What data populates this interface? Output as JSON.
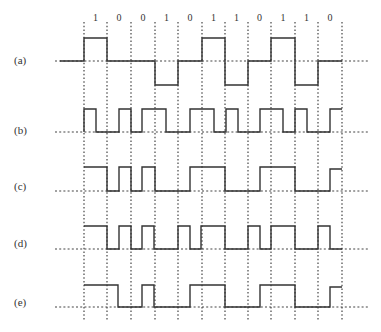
{
  "figure": {
    "bits": [
      "1",
      "0",
      "0",
      "1",
      "0",
      "1",
      "1",
      "0",
      "1",
      "1",
      "0"
    ],
    "grid_x": [
      84,
      107,
      131,
      155,
      178,
      202,
      225,
      248,
      271,
      295,
      318,
      342
    ],
    "waveforms": [
      {
        "label": "(a)",
        "label_y": 64,
        "baseline_y": 61,
        "points": "60,61 84,61 84,38 107,38 107,61 155,61 155,85 178,85 178,61 202,61 202,38 225,38 225,85 248,85 248,61 271,61 271,38 295,38 295,85 318,85 318,61 342,61"
      },
      {
        "label": "(b)",
        "label_y": 134,
        "baseline_y": 132,
        "points": "84,132 84,109 96,109 96,132 119,132 119,109 131,109 131,132 142,132 142,109 166,109 166,132 190,132 190,109 214,109 214,132 226,132 226,109 238,109 238,132 260,132 260,109 283,109 283,132 295,132 295,109 307,109 307,132 330,132 330,109 342,109"
      },
      {
        "label": "(c)",
        "label_y": 190,
        "baseline_y": 191,
        "points": "84,167 107,167 107,191 119,191 119,167 131,167 131,191 142,191 142,167 155,167 155,191 190,191 190,167 225,167 225,191 260,191 260,167 295,167 295,191 330,191 330,169 342,169"
      },
      {
        "label": "(d)",
        "label_y": 247,
        "baseline_y": 249,
        "points": "84,226 107,226 107,249 119,249 119,226 131,226 131,249 142,249 142,226 154,226 154,249 178,249 178,226 190,226 190,249 201,249 201,226 225,226 225,249 248,249 248,226 260,226 260,249 271,249 271,226 295,226 295,249 318,249 318,226 330,226 330,249 342,249"
      },
      {
        "label": "(e)",
        "label_y": 306,
        "baseline_y": 307,
        "points": "84,285 118,285 118,307 142,307 142,285 154,285 154,307 190,307 190,285 225,285 225,307 260,307 260,285 295,285 295,307 330,307 330,287 342,287"
      }
    ]
  }
}
